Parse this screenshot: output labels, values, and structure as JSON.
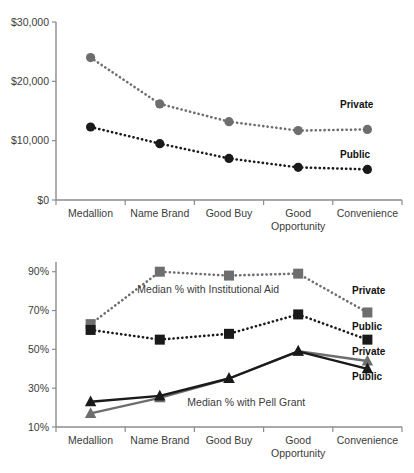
{
  "figure": {
    "background": "#ffffff",
    "colors": {
      "private": "#6e6e6e",
      "public": "#1a1a1a",
      "axis": "#8c8c8c",
      "text": "#3b3b3b"
    }
  },
  "chart_data": [
    {
      "id": "net-price-chart",
      "type": "line",
      "title": "",
      "xlabel": "",
      "ylabel": "",
      "grid": false,
      "legend_position": "right-inline",
      "categories": [
        "Medallion",
        "Name Brand",
        "Good Buy",
        "Good Opportunity",
        "Convenience"
      ],
      "category_lines": [
        [
          "Medallion"
        ],
        [
          "Name Brand"
        ],
        [
          "Good Buy"
        ],
        [
          "Good",
          "Opportunity"
        ],
        [
          "Convenience"
        ]
      ],
      "ylim": [
        0,
        30000
      ],
      "yticks": [
        0,
        10000,
        20000,
        30000
      ],
      "ytick_labels": [
        "$0",
        "$10,000",
        "$20,000",
        "$30,000"
      ],
      "series": [
        {
          "name": "Private",
          "color": "#6e6e6e",
          "marker": "circle",
          "linestyle": "dotted",
          "values": [
            24000,
            16200,
            13200,
            11700,
            11900
          ]
        },
        {
          "name": "Public",
          "color": "#1a1a1a",
          "marker": "circle",
          "linestyle": "dotted",
          "values": [
            12300,
            9500,
            7000,
            5500,
            5150
          ]
        }
      ]
    },
    {
      "id": "aid-pell-chart",
      "type": "line",
      "title": "",
      "xlabel": "",
      "ylabel": "",
      "grid": false,
      "legend_position": "right-inline",
      "categories": [
        "Medallion",
        "Name Brand",
        "Good Buy",
        "Good Opportunity",
        "Convenience"
      ],
      "category_lines": [
        [
          "Medallion"
        ],
        [
          "Name Brand"
        ],
        [
          "Good Buy"
        ],
        [
          "Good",
          "Opportunity"
        ],
        [
          "Convenience"
        ]
      ],
      "ylim": [
        10,
        95
      ],
      "yticks": [
        10,
        30,
        50,
        70,
        90
      ],
      "ytick_labels": [
        "10%",
        "30%",
        "50%",
        "70%",
        "90%"
      ],
      "annotations": [
        {
          "text": "Median % with Institutional Aid",
          "x_frac": 0.44,
          "y_value": 79
        },
        {
          "text": "Median % with Pell Grant",
          "x_frac": 0.55,
          "y_value": 21
        }
      ],
      "series": [
        {
          "name": "Private",
          "group": "Institutional Aid",
          "color": "#6e6e6e",
          "marker": "square",
          "linestyle": "dotted",
          "values": [
            63,
            90,
            88,
            89,
            69
          ]
        },
        {
          "name": "Public",
          "group": "Institutional Aid",
          "color": "#1a1a1a",
          "marker": "square",
          "linestyle": "dotted",
          "values": [
            60,
            55,
            58,
            68,
            55
          ]
        },
        {
          "name": "Private",
          "group": "Pell Grant",
          "color": "#6e6e6e",
          "marker": "triangle",
          "linestyle": "solid",
          "values": [
            17,
            25,
            35,
            49,
            44
          ]
        },
        {
          "name": "Public",
          "group": "Pell Grant",
          "color": "#1a1a1a",
          "marker": "triangle",
          "linestyle": "solid",
          "values": [
            23,
            26,
            35,
            49,
            40
          ]
        }
      ],
      "series_labels": [
        {
          "text": "Private",
          "group": "Institutional Aid"
        },
        {
          "text": "Public",
          "group": "Institutional Aid"
        },
        {
          "text": "Private",
          "group": "Pell Grant"
        },
        {
          "text": "Public",
          "group": "Pell Grant"
        }
      ]
    }
  ]
}
